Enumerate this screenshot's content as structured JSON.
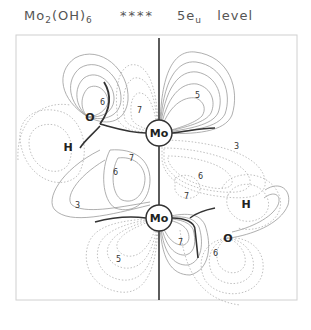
{
  "title": {
    "formula_main": "Mo",
    "formula_sub1": "2",
    "formula_mid": "(OH)",
    "formula_sub2": "6",
    "stars": "****",
    "orbital_main": "5e",
    "orbital_sub": "u",
    "level_word": "level"
  },
  "atoms": {
    "mo_top": "Mo",
    "mo_bottom": "Mo",
    "o_left": "O",
    "h_left": "H",
    "o_right": "O",
    "h_right": "H"
  },
  "contour_labels": [
    {
      "id": "l1",
      "text": "6"
    },
    {
      "id": "l2",
      "text": "7"
    },
    {
      "id": "l3",
      "text": "5"
    },
    {
      "id": "l4",
      "text": "3"
    },
    {
      "id": "l5",
      "text": "7"
    },
    {
      "id": "l6",
      "text": "6"
    },
    {
      "id": "l7",
      "text": "6"
    },
    {
      "id": "l8",
      "text": "7"
    },
    {
      "id": "l9",
      "text": "3"
    },
    {
      "id": "l10",
      "text": "7"
    },
    {
      "id": "l11",
      "text": "5"
    },
    {
      "id": "l12",
      "text": "6"
    }
  ],
  "colors": {
    "positive_contour": "#9a9a9a",
    "negative_contour": "#b0b0b0",
    "node_line": "#333333",
    "frame": "#cccccc"
  }
}
